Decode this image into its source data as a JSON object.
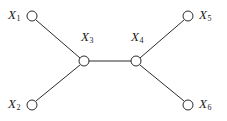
{
  "diagram": {
    "type": "undirected-graph",
    "title": "",
    "background_color": "#ffffff",
    "stroke_color": "#2b2b2b",
    "node_fill_color": "#ffffff",
    "node_radius": 5,
    "edge_width": 1,
    "nodes": [
      {
        "id": "X1",
        "letter": "X",
        "subscript": "1",
        "cx": 32,
        "cy": 16,
        "label_x": 8,
        "label_y": 8,
        "label_align": "right"
      },
      {
        "id": "X2",
        "letter": "X",
        "subscript": "2",
        "cx": 32,
        "cy": 105,
        "label_x": 8,
        "label_y": 97,
        "label_align": "right"
      },
      {
        "id": "X3",
        "letter": "X",
        "subscript": "3",
        "cx": 84,
        "cy": 61,
        "label_x": 81,
        "label_y": 30,
        "label_align": "left"
      },
      {
        "id": "X4",
        "letter": "X",
        "subscript": "4",
        "cx": 136,
        "cy": 61,
        "label_x": 131,
        "label_y": 30,
        "label_align": "left"
      },
      {
        "id": "X5",
        "letter": "X",
        "subscript": "5",
        "cx": 188,
        "cy": 16,
        "label_x": 199,
        "label_y": 8,
        "label_align": "left"
      },
      {
        "id": "X6",
        "letter": "X",
        "subscript": "6",
        "cx": 188,
        "cy": 105,
        "label_x": 199,
        "label_y": 97,
        "label_align": "left"
      }
    ],
    "edges": [
      {
        "id": "edge-x1-x3",
        "from": "X1",
        "to": "X3",
        "x1": 36,
        "y1": 20,
        "x2": 80,
        "y2": 58
      },
      {
        "id": "edge-x2-x3",
        "from": "X2",
        "to": "X3",
        "x1": 36,
        "y1": 101,
        "x2": 80,
        "y2": 65
      },
      {
        "id": "edge-x3-x4",
        "from": "X3",
        "to": "X4",
        "x1": 89,
        "y1": 61,
        "x2": 131,
        "y2": 61
      },
      {
        "id": "edge-x4-x5",
        "from": "X4",
        "to": "X5",
        "x1": 140,
        "y1": 58,
        "x2": 184,
        "y2": 20
      },
      {
        "id": "edge-x4-x6",
        "from": "X4",
        "to": "X6",
        "x1": 140,
        "y1": 65,
        "x2": 184,
        "y2": 101
      }
    ]
  }
}
